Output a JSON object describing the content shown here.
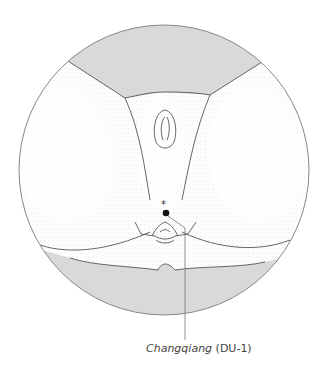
{
  "figure": {
    "point": {
      "name": "Changqiang",
      "code": "(DU-1)"
    },
    "colors": {
      "background_band": "#d8d8d8",
      "outline": "#666666",
      "point_marker": "#111111",
      "leader_line": "#777777"
    }
  }
}
